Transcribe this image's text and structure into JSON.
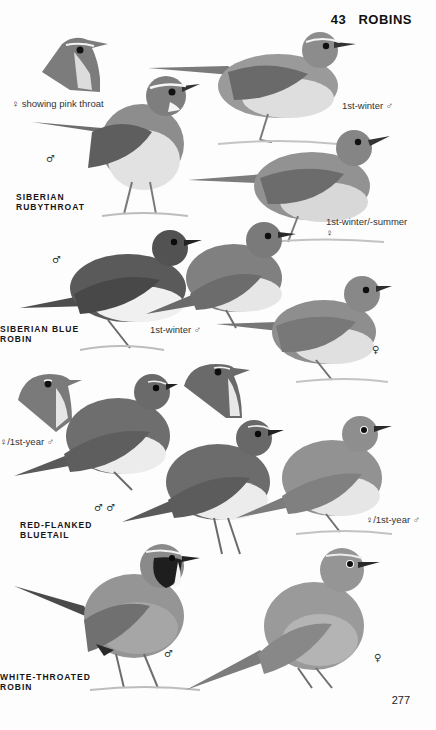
{
  "header": {
    "plate_number": "43",
    "title": "ROBINS"
  },
  "species": [
    {
      "name_line1": "SIBERIAN",
      "name_line2": "RUBYTHROAT"
    },
    {
      "name_line1": "SIBERIAN BLUE",
      "name_line2": "ROBIN"
    },
    {
      "name_line1": "RED-FLANKED",
      "name_line2": "BLUETAIL"
    },
    {
      "name_line1": "WHITE-THROATED",
      "name_line2": "ROBIN"
    }
  ],
  "captions": {
    "rubythroat_head": "♀ showing pink throat",
    "rubythroat_male": "♂",
    "rubythroat_1st_winter": "1st-winter ♂",
    "rubythroat_female_line1": "1st-winter/-summer",
    "rubythroat_female_line2": "♀",
    "blue_robin_male": "♂",
    "blue_robin_1st_winter": "1st-winter ♂",
    "blue_robin_female": "♀",
    "bluetail_head": "♀/1st-year ♂",
    "bluetail_males": "♂ ♂",
    "bluetail_female": "♀/1st-year ♂",
    "white_throated_male": "♂",
    "white_throated_female": "♀"
  },
  "page_number": "277",
  "colors": {
    "ink": "#1a1a1a",
    "bird_dark": "#5a5a5a",
    "bird_mid": "#8a8a8a",
    "bird_light": "#d6d6d6",
    "ground": "#b5b5b5"
  }
}
